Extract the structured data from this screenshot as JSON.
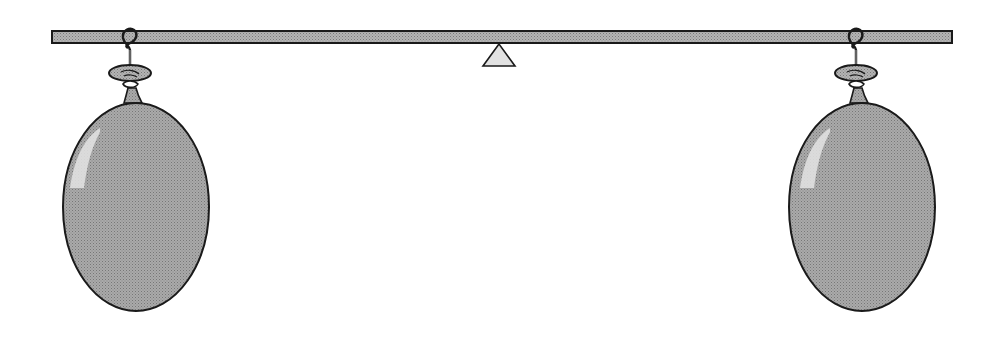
{
  "title": "Balance beam with two balloons",
  "colors": {
    "background": "#ffffff",
    "beam_fill": "#a8a8a8",
    "balloon_fill": "#a0a0a0",
    "outline": "#1a1a1a",
    "fulcrum_fill": "#e0e0e0",
    "highlight": "#e6e6e6"
  },
  "beam": {
    "x": 52,
    "y": 31,
    "width": 900,
    "height": 12
  },
  "fulcrum": {
    "cx": 499,
    "top": 44,
    "base": 66,
    "half_width": 16
  },
  "balloons": [
    {
      "name": "left-balloon",
      "cx": 136,
      "cy": 207,
      "rx": 73,
      "ry": 104,
      "hook_x": 130,
      "knot_y": 86
    },
    {
      "name": "right-balloon",
      "cx": 862,
      "cy": 207,
      "rx": 73,
      "ry": 104,
      "hook_x": 856,
      "knot_y": 86
    }
  ]
}
